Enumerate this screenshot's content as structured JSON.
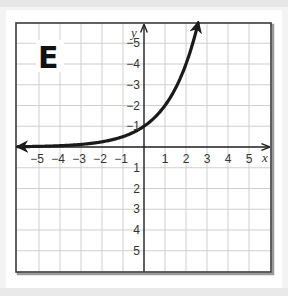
{
  "figure": {
    "panel_label": "E",
    "x_axis_label": "x",
    "y_axis_label": "y",
    "x_tick_labels": [
      "−5",
      "−4",
      "−3",
      "−2",
      "−1",
      "1",
      "2",
      "3",
      "4",
      "5"
    ],
    "y_tick_labels": [
      "5",
      "4",
      "3",
      "2",
      "1",
      "−1",
      "−2",
      "−3",
      "−4",
      "−5"
    ]
  },
  "colors": {
    "curve": "#1a1a1a",
    "grid": "#cfcfcf",
    "frame": "#3a3a3a",
    "background": "#ffffff"
  },
  "chart_data": {
    "type": "line",
    "title": "E",
    "xlabel": "x",
    "ylabel": "y",
    "xlim": [
      -6,
      6
    ],
    "ylim": [
      -6,
      6
    ],
    "grid": true,
    "x_ticks": [
      -5,
      -4,
      -3,
      -2,
      -1,
      1,
      2,
      3,
      4,
      5
    ],
    "y_ticks": [
      -5,
      -4,
      -3,
      -2,
      -1,
      1,
      2,
      3,
      4,
      5
    ],
    "annotations": [
      "Curve has arrowheads on both ends (extends left along asymptote y=0 and upward)"
    ],
    "series": [
      {
        "name": "exponential curve (y = 2^x)",
        "x": [
          -6,
          -5,
          -4,
          -3,
          -2,
          -1,
          0,
          1,
          2,
          2.58
        ],
        "y": [
          0.016,
          0.031,
          0.063,
          0.125,
          0.25,
          0.5,
          1,
          2,
          4,
          6
        ]
      }
    ]
  }
}
